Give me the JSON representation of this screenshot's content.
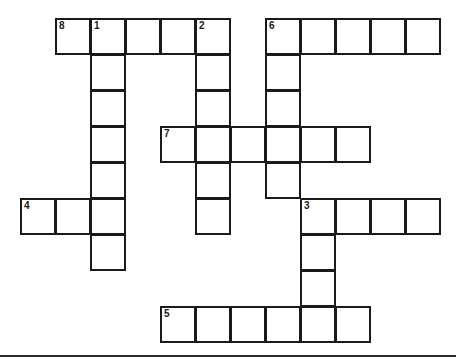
{
  "puzzle": {
    "type": "crossword",
    "cell_size": 35,
    "origin": {
      "x": 20,
      "y": 18
    },
    "row_height": 36,
    "cells": [
      {
        "r": 0,
        "c": 1,
        "num": "8"
      },
      {
        "r": 0,
        "c": 2,
        "num": "1"
      },
      {
        "r": 0,
        "c": 3
      },
      {
        "r": 0,
        "c": 4
      },
      {
        "r": 0,
        "c": 5,
        "num": "2"
      },
      {
        "r": 0,
        "c": 7,
        "num": "6"
      },
      {
        "r": 0,
        "c": 8
      },
      {
        "r": 0,
        "c": 9
      },
      {
        "r": 0,
        "c": 10
      },
      {
        "r": 0,
        "c": 11
      },
      {
        "r": 1,
        "c": 2
      },
      {
        "r": 1,
        "c": 5
      },
      {
        "r": 1,
        "c": 7
      },
      {
        "r": 2,
        "c": 2
      },
      {
        "r": 2,
        "c": 5
      },
      {
        "r": 2,
        "c": 7
      },
      {
        "r": 3,
        "c": 2
      },
      {
        "r": 3,
        "c": 4,
        "num": "7"
      },
      {
        "r": 3,
        "c": 5
      },
      {
        "r": 3,
        "c": 6
      },
      {
        "r": 3,
        "c": 7
      },
      {
        "r": 3,
        "c": 8
      },
      {
        "r": 3,
        "c": 9
      },
      {
        "r": 4,
        "c": 2
      },
      {
        "r": 4,
        "c": 5
      },
      {
        "r": 4,
        "c": 7
      },
      {
        "r": 5,
        "c": 0,
        "num": "4"
      },
      {
        "r": 5,
        "c": 1
      },
      {
        "r": 5,
        "c": 2
      },
      {
        "r": 5,
        "c": 5
      },
      {
        "r": 5,
        "c": 8,
        "num": "3"
      },
      {
        "r": 5,
        "c": 9
      },
      {
        "r": 5,
        "c": 10
      },
      {
        "r": 5,
        "c": 11
      },
      {
        "r": 6,
        "c": 2
      },
      {
        "r": 6,
        "c": 8
      },
      {
        "r": 7,
        "c": 8
      },
      {
        "r": 8,
        "c": 4,
        "num": "5"
      },
      {
        "r": 8,
        "c": 5
      },
      {
        "r": 8,
        "c": 6
      },
      {
        "r": 8,
        "c": 7
      },
      {
        "r": 8,
        "c": 8
      },
      {
        "r": 8,
        "c": 9
      }
    ],
    "entries": {
      "across": [
        {
          "number": "8",
          "length": 5
        },
        {
          "number": "6",
          "length": 5
        },
        {
          "number": "7",
          "length": 6
        },
        {
          "number": "4",
          "length": 3
        },
        {
          "number": "3",
          "length": 4
        },
        {
          "number": "5",
          "length": 6
        }
      ],
      "down": [
        {
          "number": "1",
          "length": 7
        },
        {
          "number": "2",
          "length": 6
        },
        {
          "number": "6",
          "length": 5
        },
        {
          "number": "3",
          "length": 4
        }
      ]
    },
    "colors": {
      "line": "#1a1a1a",
      "background": "#ffffff"
    }
  }
}
